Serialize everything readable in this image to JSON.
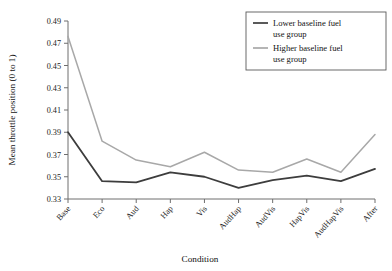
{
  "chart_data": {
    "type": "line",
    "title": "",
    "xlabel": "Condition",
    "ylabel": "Mean throttle position (0 to 1)",
    "categories": [
      "Base",
      "Eco",
      "Aud",
      "Hap",
      "Vis",
      "AudHap",
      "AudVis",
      "HapVis",
      "AudHapVis",
      "After"
    ],
    "ylim": [
      0.33,
      0.49
    ],
    "ytick_step": 0.02,
    "yticks": [
      "0.33",
      "0.35",
      "0.37",
      "0.39",
      "0.41",
      "0.43",
      "0.45",
      "0.47",
      "0.49"
    ],
    "grid": false,
    "legend_position": "top-right",
    "series": [
      {
        "name": "Lower baseline fuel use group",
        "color": "#3d3d3d",
        "values": [
          0.39,
          0.346,
          0.345,
          0.354,
          0.35,
          0.34,
          0.347,
          0.351,
          0.346,
          0.357
        ]
      },
      {
        "name": "Higher baseline fuel use group",
        "color": "#a8a8a8",
        "values": [
          0.476,
          0.382,
          0.365,
          0.359,
          0.372,
          0.356,
          0.354,
          0.366,
          0.354,
          0.388
        ]
      }
    ]
  },
  "legend": {
    "entries": [
      {
        "label_line1": "Lower baseline fuel",
        "label_line2": "use group"
      },
      {
        "label_line1": "Higher baseline fuel",
        "label_line2": "use group"
      }
    ]
  },
  "axes": {
    "x_title": "Condition",
    "y_title": "Mean throttle position (0 to 1)"
  }
}
